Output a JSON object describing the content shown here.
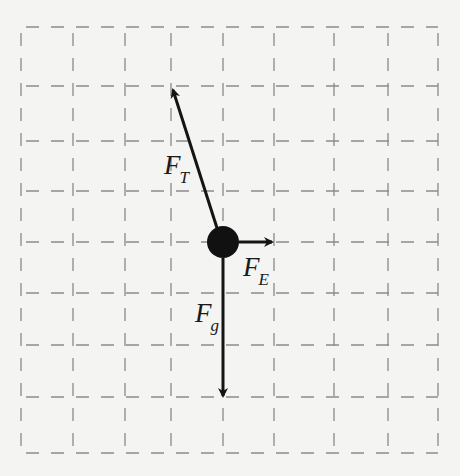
{
  "diagram": {
    "type": "free-body-diagram",
    "grid": {
      "x_lines": [
        21,
        73,
        125,
        171,
        223,
        274,
        334,
        388,
        438
      ],
      "y_lines": [
        27,
        86,
        141,
        191,
        242,
        293,
        345,
        397,
        453
      ],
      "line_color": "#8a8a8a",
      "style": "dashed"
    },
    "object": {
      "shape": "circle",
      "cx": 223,
      "cy": 242,
      "r": 16,
      "color": "#111111"
    },
    "forces": [
      {
        "id": "tension",
        "symbol": "F",
        "subscript": "T",
        "direction": "up-left",
        "x1": 217,
        "y1": 228,
        "x2": 173,
        "y2": 90
      },
      {
        "id": "electric",
        "symbol": "F",
        "subscript": "E",
        "direction": "right",
        "x1": 239,
        "y1": 242,
        "x2": 272,
        "y2": 242
      },
      {
        "id": "gravity",
        "symbol": "F",
        "subscript": "g",
        "direction": "down",
        "x1": 223,
        "y1": 258,
        "x2": 223,
        "y2": 396
      }
    ],
    "labels": {
      "tension": {
        "main": "F",
        "sub": "T"
      },
      "electric": {
        "main": "F",
        "sub": "E"
      },
      "gravity": {
        "main": "F",
        "sub": "g"
      }
    },
    "arrow_color": "#141414"
  }
}
